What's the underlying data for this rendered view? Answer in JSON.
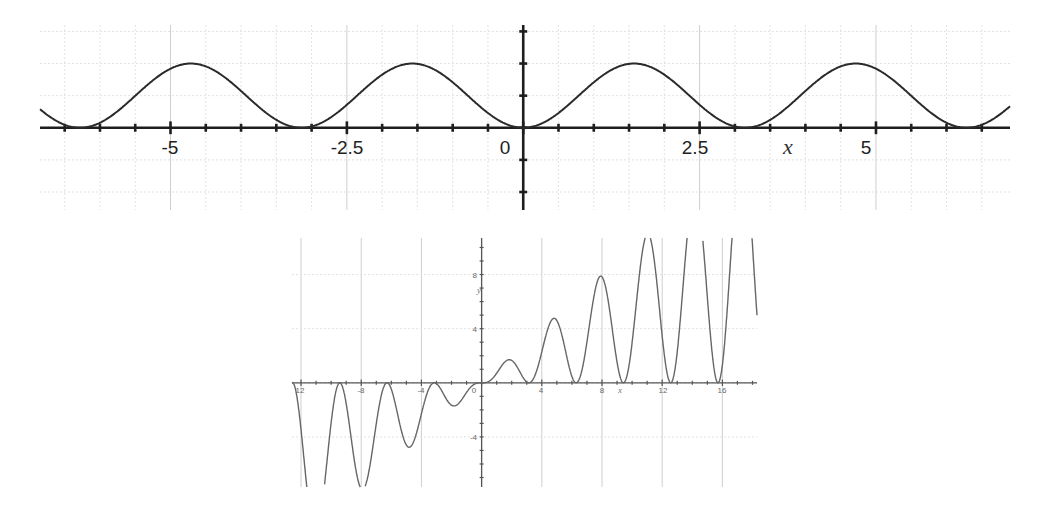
{
  "chart_data": [
    {
      "type": "line",
      "title": "",
      "function": "y = sin^2(x)",
      "xlabel": "x",
      "ylabel": "",
      "xlim": [
        -6.85,
        6.9
      ],
      "ylim": [
        -1.28,
        1.6
      ],
      "x_ticks": [
        -5,
        -2.5,
        0,
        2.5,
        5
      ],
      "x_tick_labels": [
        "-5",
        "-2.5",
        "0",
        "2.5",
        "5"
      ],
      "x_minor_step": 0.5,
      "y_minor_step": 0.5,
      "y_tick_labels": [],
      "grid": true,
      "series": [
        {
          "name": "sin^2(x)",
          "x": [
            -6.85,
            -6.28,
            -4.71,
            -3.14,
            -1.57,
            0,
            1.57,
            3.14,
            4.71,
            6.28,
            6.9
          ],
          "values": [
            0.29,
            0,
            1,
            0,
            1,
            0,
            1,
            0,
            1,
            0,
            0.33
          ]
        }
      ]
    },
    {
      "type": "line",
      "title": "",
      "function": "y = x*sin^2(x)",
      "xlabel": "x",
      "ylabel": "y",
      "xlim": [
        -12.6,
        18.3
      ],
      "ylim": [
        -7.7,
        10.7
      ],
      "x_ticks": [
        -12,
        -8,
        -4,
        0,
        4,
        8,
        12,
        16
      ],
      "x_tick_labels": [
        "12",
        "-8",
        "-4",
        "0",
        "4",
        "8",
        "12",
        "16"
      ],
      "y_ticks": [
        -4,
        4,
        8
      ],
      "y_tick_labels": [
        "-4",
        "4",
        "8"
      ],
      "grid": true,
      "series": [
        {
          "name": "x*sin^2(x)",
          "x": [
            -10.99,
            -9.42,
            -7.85,
            -6.28,
            -4.71,
            -3.14,
            -1.57,
            0,
            1.57,
            3.14,
            4.71,
            6.28,
            7.85,
            9.42,
            10.99,
            12.57,
            15.71,
            18.3
          ],
          "values": [
            -10.99,
            0,
            -7.85,
            0,
            -4.71,
            0,
            -1.57,
            0,
            1.57,
            0,
            4.71,
            0,
            7.85,
            0,
            10.99,
            0,
            0,
            4.9
          ]
        }
      ]
    }
  ],
  "top_chart": {
    "x_label": "x",
    "tick_labels": [
      "-5",
      "-2.5",
      "0",
      "2.5",
      "5"
    ]
  },
  "bottom_chart": {
    "x_label": "x",
    "y_label": "y",
    "x_tick_labels": [
      "12",
      "-8",
      "-4",
      "0",
      "4",
      "8",
      "12",
      "16"
    ],
    "y_tick_labels": [
      "8",
      "4",
      "-4"
    ]
  }
}
